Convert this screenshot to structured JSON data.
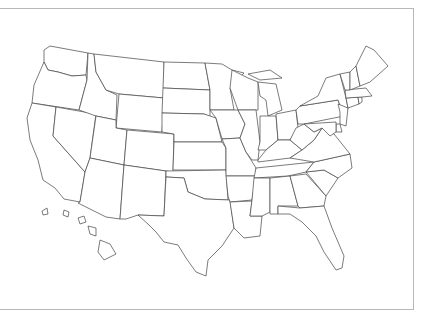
{
  "map": {
    "title": "United States (blank state outline map)",
    "frame_color": "#b8b8b8",
    "stroke_color": "#444444",
    "fill_color": "#ffffff",
    "states": [
      {
        "id": "WA",
        "d": "M50,46 L88,53 L86,75 L72,76 L58,72 L48,70 L44,62 L44,50 Z"
      },
      {
        "id": "OR",
        "d": "M44,62 L48,70 L58,72 L72,76 L86,75 L87,80 L79,110 L32,103 L34,85 Z"
      },
      {
        "id": "CA",
        "d": "M32,103 L56,107 L53,136 L85,172 L80,202 L64,199 L55,188 L43,180 L38,160 L30,140 L27,118 Z"
      },
      {
        "id": "NV",
        "d": "M56,107 L96,114 L90,158 L85,172 L53,136 Z"
      },
      {
        "id": "ID",
        "d": "M88,53 L94,54 L96,72 L106,90 L117,95 L116,120 L96,116 L79,110 L87,80 Z"
      },
      {
        "id": "MT",
        "d": "M94,54 L164,62 L164,98 L119,94 L106,90 L96,72 Z"
      },
      {
        "id": "WY",
        "d": "M119,94 L164,98 L162,132 L116,128 Z"
      },
      {
        "id": "UT",
        "d": "M96,116 L116,120 L116,128 L127,130 L124,165 L90,158 Z"
      },
      {
        "id": "AZ",
        "d": "M90,158 L124,165 L120,219 L106,217 L78,203 L80,202 L85,172 Z"
      },
      {
        "id": "CO",
        "d": "M127,130 L174,134 L173,172 L124,165 Z"
      },
      {
        "id": "NM",
        "d": "M124,165 L166,171 L164,216 L138,215 L126,219 L120,219 Z"
      },
      {
        "id": "ND",
        "d": "M164,62 L205,63 L210,90 L163,88 Z"
      },
      {
        "id": "SD",
        "d": "M163,88 L210,90 L210,117 L204,114 L162,113 Z"
      },
      {
        "id": "NE",
        "d": "M162,113 L204,114 L216,118 L222,142 L174,142 L174,134 L162,132 Z"
      },
      {
        "id": "KS",
        "d": "M174,142 L222,142 L226,148 L226,170 L173,170 Z"
      },
      {
        "id": "OK",
        "d": "M166,171 L226,170 L228,200 L205,199 L188,192 L184,178 L166,177 Z"
      },
      {
        "id": "TX",
        "d": "M166,177 L184,178 L188,192 L205,199 L230,200 L234,228 L222,246 L208,260 L206,276 L196,272 L186,258 L178,245 L164,242 L156,232 L149,225 L138,215 L164,216 Z"
      },
      {
        "id": "MN",
        "d": "M205,63 L222,64 L232,70 L244,73 L230,88 L234,110 L210,110 L210,90 Z"
      },
      {
        "id": "IA",
        "d": "M210,110 L238,110 L245,124 L240,138 L222,139 L216,118 Z"
      },
      {
        "id": "MO",
        "d": "M222,139 L240,138 L246,152 L256,168 L256,176 L226,176 L226,148 Z"
      },
      {
        "id": "AR",
        "d": "M226,176 L256,176 L252,200 L230,202 L228,196 Z"
      },
      {
        "id": "LA",
        "d": "M230,202 L252,201 L250,216 L262,216 L260,236 L244,238 L234,228 Z"
      },
      {
        "id": "WI",
        "d": "M232,70 L248,78 L258,82 L258,110 L238,110 L230,88 Z"
      },
      {
        "id": "IL",
        "d": "M238,110 L256,110 L260,142 L258,160 L252,160 L246,152 L240,138 L245,124 Z"
      },
      {
        "id": "MI",
        "d": "M258,82 L276,84 L282,110 L268,116 L266,100 L260,96 Z M248,74 L270,70 L282,78 L260,80 Z"
      },
      {
        "id": "IN",
        "d": "M260,116 L276,116 L278,140 L266,150 L258,150 L260,142 Z"
      },
      {
        "id": "OH",
        "d": "M276,114 L296,110 L298,128 L290,140 L278,140 Z"
      },
      {
        "id": "KY",
        "d": "M258,160 L266,150 L278,140 L290,140 L302,150 L290,158 L258,162 Z"
      },
      {
        "id": "TN",
        "d": "M256,168 L314,162 L306,172 L288,176 L254,178 Z"
      },
      {
        "id": "MS",
        "d": "M254,178 L270,178 L270,212 L262,216 L250,216 L252,200 Z"
      },
      {
        "id": "AL",
        "d": "M270,178 L290,176 L298,206 L278,206 L278,214 L270,214 Z"
      },
      {
        "id": "GA",
        "d": "M290,176 L306,174 L326,196 L324,206 L300,208 L298,206 Z"
      },
      {
        "id": "FL",
        "d": "M278,206 L300,208 L324,206 L332,228 L344,256 L342,268 L336,270 L324,252 L316,236 L302,222 L290,214 L278,214 Z"
      },
      {
        "id": "SC",
        "d": "M306,172 L324,170 L338,178 L326,196 Z"
      },
      {
        "id": "NC",
        "d": "M314,162 L350,154 L352,168 L338,178 L324,170 L306,172 Z"
      },
      {
        "id": "VA",
        "d": "M302,150 L314,140 L322,128 L334,134 L350,154 L314,162 L290,158 Z"
      },
      {
        "id": "WV",
        "d": "M296,128 L304,124 L314,132 L322,128 L314,140 L302,150 L290,140 Z"
      },
      {
        "id": "PA",
        "d": "M296,110 L300,106 L338,100 L344,116 L304,124 L298,124 Z"
      },
      {
        "id": "NY",
        "d": "M300,106 L318,96 L326,78 L340,74 L346,98 L348,108 L344,116 L338,100 Z"
      },
      {
        "id": "NJ",
        "d": "M338,104 L348,108 L346,126 L340,124 L340,112 Z"
      },
      {
        "id": "DE",
        "d": "M336,124 L340,124 L342,132 L336,132 Z"
      },
      {
        "id": "MD",
        "d": "M304,124 L336,122 L336,132 L330,136 L322,128 L314,132 Z"
      },
      {
        "id": "CT",
        "d": "M346,98 L358,97 L359,104 L348,108 Z"
      },
      {
        "id": "RI",
        "d": "M358,97 L362,97 L362,102 L359,104 Z"
      },
      {
        "id": "MA",
        "d": "M345,90 L366,88 L372,96 L362,97 L346,98 Z"
      },
      {
        "id": "VT",
        "d": "M340,74 L350,72 L350,90 L345,90 Z"
      },
      {
        "id": "NH",
        "d": "M350,72 L356,66 L360,86 L350,90 Z"
      },
      {
        "id": "ME",
        "d": "M356,66 L366,46 L374,50 L388,66 L370,82 L360,86 Z"
      },
      {
        "id": "HI-1",
        "d": "M42,211 L47,208 L48,214 L43,215 Z"
      },
      {
        "id": "HI-2",
        "d": "M64,210 L69,212 L68,217 L63,215 Z"
      },
      {
        "id": "HI-3",
        "d": "M78,218 L84,216 L86,222 L80,224 Z"
      },
      {
        "id": "HI-4",
        "d": "M88,226 L96,228 L96,236 L90,234 Z"
      },
      {
        "id": "HI-5",
        "d": "M100,240 L110,244 L116,254 L104,260 L98,252 Z"
      }
    ]
  }
}
